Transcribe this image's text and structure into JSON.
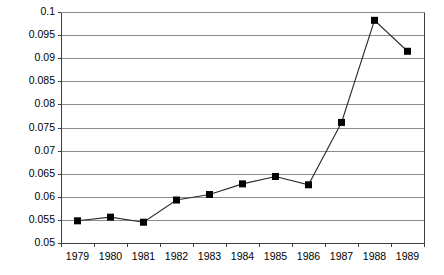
{
  "chart_data": {
    "type": "line",
    "title": "",
    "subtitle": "",
    "xlabel": "",
    "ylabel": "",
    "categories": [
      "1979",
      "1980",
      "1981",
      "1982",
      "1983",
      "1984",
      "1985",
      "1986",
      "1987",
      "1988",
      "1989"
    ],
    "x": [
      1979,
      1980,
      1981,
      1982,
      1983,
      1984,
      1985,
      1986,
      1987,
      1988,
      1989
    ],
    "values": [
      0.0548,
      0.0556,
      0.0545,
      0.0593,
      0.0605,
      0.0628,
      0.0644,
      0.0626,
      0.0761,
      0.0982,
      0.0915
    ],
    "series": [
      {
        "name": "series-1",
        "values": [
          0.0548,
          0.0556,
          0.0545,
          0.0593,
          0.0605,
          0.0628,
          0.0644,
          0.0626,
          0.0761,
          0.0982,
          0.0915
        ]
      }
    ],
    "ylim": [
      0.05,
      0.1
    ],
    "yticks": [
      0.05,
      0.055,
      0.06,
      0.065,
      0.07,
      0.075,
      0.08,
      0.085,
      0.09,
      0.095,
      0.1
    ],
    "ytick_labels": [
      "0.05",
      "0.055",
      "0.06",
      "0.065",
      "0.07",
      "0.075",
      "0.08",
      "0.085",
      "0.09",
      "0.095",
      "0.1"
    ],
    "xtick_labels": [
      "1979",
      "1980",
      "1981",
      "1982",
      "1983",
      "1984",
      "1985",
      "1986",
      "1987",
      "1988",
      "1989"
    ],
    "grid": true,
    "grid_axis": "y",
    "legend": false,
    "legend_position": "none",
    "marker": "square",
    "line_color": "#2b2b2b",
    "marker_color": "#000000",
    "grid_color": "#8c8c8c",
    "axis_color": "#404040",
    "background": "#ffffff"
  },
  "plot_area": {
    "left": 61,
    "right": 424,
    "top": 12,
    "bottom": 243
  }
}
